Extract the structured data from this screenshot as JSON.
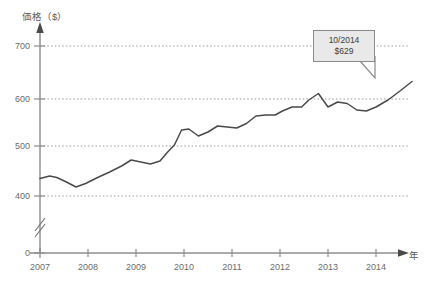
{
  "chart_data": {
    "type": "line",
    "title": "",
    "xlabel": "年",
    "ylabel": "価格（$）",
    "xlim": [
      2007,
      2014.83
    ],
    "ylim": [
      380,
      720
    ],
    "grid": true,
    "grid_style": "dotted-horizontal",
    "legend": "none",
    "y_ticks": [
      0,
      400,
      500,
      600,
      700
    ],
    "y_tick_labels": [
      "0",
      "400",
      "500",
      "600",
      "700"
    ],
    "x_ticks": [
      2007,
      2008,
      2009,
      2010,
      2011,
      2012,
      2013,
      2014
    ],
    "x_tick_labels": [
      "2007",
      "2008",
      "2009",
      "2010",
      "2011",
      "2012",
      "2013",
      "2014"
    ],
    "axis_break": true,
    "axis_break_note": "y-axis broken between 0 and 400",
    "series": [
      {
        "name": "価格",
        "color": "#4a4a4a",
        "x": [
          2007.0,
          2007.2,
          2007.35,
          2007.55,
          2007.75,
          2007.95,
          2008.2,
          2008.45,
          2008.7,
          2008.9,
          2009.1,
          2009.3,
          2009.5,
          2009.65,
          2009.8,
          2009.95,
          2010.1,
          2010.3,
          2010.5,
          2010.7,
          2010.9,
          2011.1,
          2011.3,
          2011.5,
          2011.7,
          2011.9,
          2012.05,
          2012.25,
          2012.45,
          2012.6,
          2012.8,
          2013.0,
          2013.2,
          2013.4,
          2013.6,
          2013.8,
          2014.0,
          2014.25,
          2014.5,
          2014.75
        ],
        "y": [
          435,
          440,
          437,
          428,
          418,
          425,
          437,
          448,
          460,
          472,
          468,
          464,
          470,
          487,
          502,
          532,
          534,
          520,
          528,
          540,
          538,
          536,
          545,
          560,
          562,
          562,
          570,
          578,
          578,
          592,
          605,
          578,
          588,
          585,
          572,
          570,
          578,
          592,
          610,
          629
        ]
      }
    ],
    "annotations": [
      {
        "name": "callout",
        "line1": "10/2014",
        "line2": "$629",
        "point_x": 2014.75,
        "point_y": 629,
        "box_fill": "#e9e9e9",
        "box_border": "#8a8a8a"
      }
    ],
    "colors": {
      "line": "#4a4a4a",
      "axis": "#8c8c8c",
      "grid": "#9a9a9a",
      "text": "#6b6b6b",
      "background": "#ffffff"
    }
  }
}
